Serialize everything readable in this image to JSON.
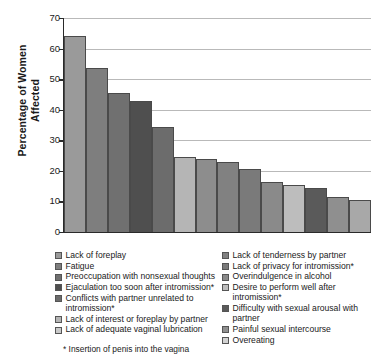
{
  "chart_data": {
    "type": "bar",
    "title": "",
    "xlabel": "",
    "ylabel": "Percentage of Women Affected",
    "ylim": [
      0,
      70
    ],
    "ytick_values": [
      70,
      60,
      50,
      40,
      30,
      20,
      10,
      0
    ],
    "grid": true,
    "legend_position": "bottom",
    "categories": [
      "Lack of foreplay",
      "Fatigue",
      "Preoccupation with nonsexual thoughts",
      "Ejaculation too soon after intromission*",
      "Conflicts with partner unrelated to intromission*",
      "Lack of interest or foreplay by partner",
      "Lack of adequate vaginal lubrication",
      "Lack of tenderness by partner",
      "Lack of privacy for intromission*",
      "Overindulgence in alcohol",
      "Desire to perform well after intromission*",
      "Difficulty with sexual arousal with partner",
      "Painful sexual intercourse",
      "Overeating"
    ],
    "values": [
      64,
      53.5,
      45.5,
      43,
      34.5,
      24.5,
      24,
      23,
      20.5,
      16.5,
      15.5,
      14.5,
      11.5,
      10.5
    ],
    "bar_colors": [
      "#9a9a9a",
      "#7e7e7e",
      "#707070",
      "#4f4f4f",
      "#6c6c6c",
      "#b5b5b5",
      "#8d8d8d",
      "#818181",
      "#7a7a7a",
      "#8a8a8a",
      "#bdbdbd",
      "#5a5a5a",
      "#8f8f8f",
      "#a8a8a8"
    ]
  },
  "axis": {
    "y_title_line1": "Percentage of Women",
    "y_title_line2": "Affected",
    "ticks": [
      "70",
      "60",
      "50",
      "40",
      "30",
      "20",
      "10",
      "0"
    ]
  },
  "legend": {
    "left_column": [
      {
        "label": "Lack of foreplay",
        "color": "#9a9a9a"
      },
      {
        "label": "Fatigue",
        "color": "#7e7e7e"
      },
      {
        "label": "Preoccupation with nonsexual thoughts",
        "color": "#707070"
      },
      {
        "label": "Ejaculation too soon after intromission*",
        "color": "#4f4f4f"
      },
      {
        "label": "Conflicts with partner unrelated to intromission*",
        "color": "#6c6c6c"
      },
      {
        "label": "Lack of interest or foreplay by partner",
        "color": "#b5b5b5"
      },
      {
        "label": "Lack of adequate vaginal lubrication",
        "color": "#c9c9c9"
      }
    ],
    "right_column": [
      {
        "label": "Lack of tenderness by partner",
        "color": "#818181"
      },
      {
        "label": "Lack of privacy for intromission*",
        "color": "#7a7a7a"
      },
      {
        "label": "Overindulgence in alcohol",
        "color": "#8a8a8a"
      },
      {
        "label": "Desire to perform well after intromission*",
        "color": "#bdbdbd"
      },
      {
        "label": "Difficulty with sexual arousal with partner",
        "color": "#5a5a5a"
      },
      {
        "label": "Painful sexual intercourse",
        "color": "#8f8f8f"
      },
      {
        "label": "Overeating",
        "color": "#d2d2d2"
      }
    ]
  },
  "footnote": "* Insertion of penis into the vagina"
}
